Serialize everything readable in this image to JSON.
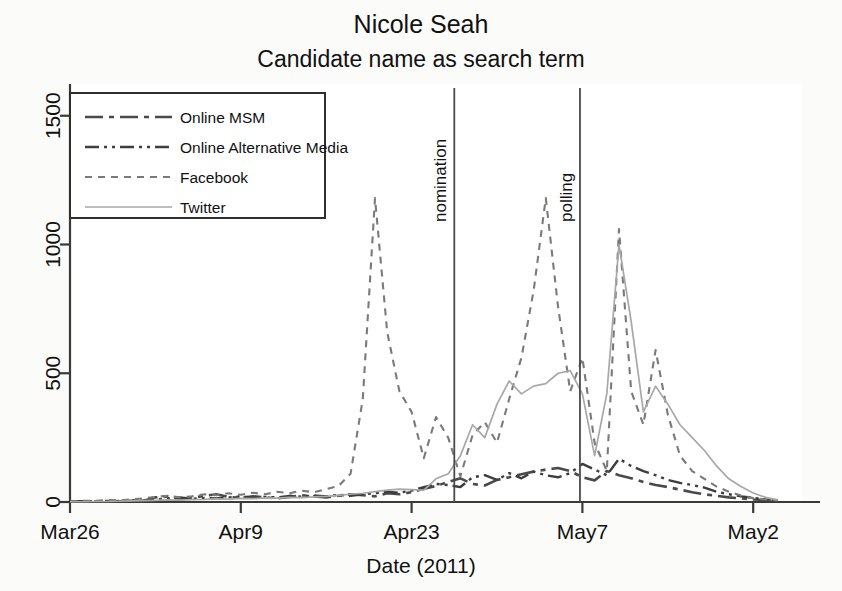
{
  "chart_data": {
    "type": "line",
    "title": "Nicole Seah",
    "subtitle": "Candidate name as search term",
    "xlabel": "Date (2011)",
    "ylabel": "",
    "xlim": [
      0,
      60
    ],
    "ylim": [
      0,
      1600
    ],
    "grid": false,
    "legend_position": "top-left",
    "y_ticks": [
      0,
      500,
      1000,
      1500
    ],
    "y_tick_labels": [
      "0",
      "500",
      "1000",
      "1500"
    ],
    "x_ticks": [
      0,
      14,
      28,
      42,
      56
    ],
    "x_tick_labels": [
      "Mar26",
      "Apr9",
      "Apr23",
      "May7",
      "May2"
    ],
    "annotations": [
      {
        "label": "nomination",
        "x": 31.5
      },
      {
        "label": "polling",
        "x": 41.8
      }
    ],
    "series": [
      {
        "name": "Online MSM",
        "style": "dash-dot-long",
        "color": "#4a4a4a",
        "x": [
          0,
          1,
          2,
          3,
          4,
          5,
          6,
          7,
          8,
          9,
          10,
          11,
          12,
          13,
          14,
          15,
          16,
          17,
          18,
          19,
          20,
          21,
          22,
          23,
          24,
          25,
          26,
          27,
          28,
          29,
          30,
          31,
          32,
          33,
          34,
          35,
          36,
          37,
          38,
          39,
          40,
          41,
          42,
          43,
          44,
          45,
          46,
          47,
          48,
          49,
          50,
          51,
          52,
          53,
          54,
          55,
          56,
          57,
          58
        ],
        "values": [
          2,
          3,
          2,
          4,
          3,
          5,
          4,
          18,
          22,
          12,
          16,
          24,
          30,
          20,
          16,
          22,
          18,
          14,
          20,
          26,
          22,
          18,
          24,
          30,
          26,
          22,
          34,
          30,
          38,
          52,
          62,
          78,
          92,
          70,
          64,
          86,
          96,
          108,
          118,
          126,
          132,
          120,
          96,
          84,
          120,
          104,
          92,
          78,
          66,
          58,
          48,
          38,
          30,
          24,
          18,
          14,
          10,
          8,
          6
        ]
      },
      {
        "name": "Online Alternative Media",
        "style": "dash-dot-dot",
        "color": "#3d3d3d",
        "x": [
          0,
          1,
          2,
          3,
          4,
          5,
          6,
          7,
          8,
          9,
          10,
          11,
          12,
          13,
          14,
          15,
          16,
          17,
          18,
          19,
          20,
          21,
          22,
          23,
          24,
          25,
          26,
          27,
          28,
          29,
          30,
          31,
          32,
          33,
          34,
          35,
          36,
          37,
          38,
          39,
          40,
          41,
          42,
          43,
          44,
          45,
          46,
          47,
          48,
          49,
          50,
          51,
          52,
          53,
          54,
          55,
          56,
          57,
          58
        ],
        "values": [
          1,
          2,
          3,
          2,
          4,
          6,
          5,
          10,
          14,
          18,
          12,
          16,
          14,
          18,
          22,
          16,
          20,
          18,
          24,
          20,
          26,
          22,
          28,
          24,
          30,
          34,
          40,
          36,
          44,
          58,
          70,
          66,
          58,
          96,
          104,
          86,
          112,
          92,
          118,
          104,
          96,
          112,
          148,
          126,
          104,
          168,
          140,
          120,
          104,
          86,
          74,
          66,
          56,
          40,
          30,
          22,
          16,
          10,
          6
        ]
      },
      {
        "name": "Facebook",
        "style": "dashed",
        "color": "#7a7a7a",
        "x": [
          0,
          1,
          2,
          3,
          4,
          5,
          6,
          7,
          8,
          9,
          10,
          11,
          12,
          13,
          14,
          15,
          16,
          17,
          18,
          19,
          20,
          21,
          22,
          23,
          24,
          25,
          26,
          27,
          28,
          29,
          30,
          31,
          32,
          33,
          34,
          35,
          36,
          37,
          38,
          39,
          40,
          41,
          42,
          43,
          44,
          45,
          46,
          47,
          48,
          49,
          50,
          51,
          52,
          53,
          54,
          55,
          56,
          57,
          58
        ],
        "values": [
          3,
          5,
          4,
          8,
          6,
          10,
          14,
          20,
          24,
          18,
          22,
          30,
          26,
          34,
          28,
          36,
          30,
          40,
          34,
          44,
          38,
          50,
          62,
          110,
          400,
          1180,
          660,
          430,
          350,
          170,
          330,
          250,
          100,
          260,
          310,
          230,
          400,
          560,
          820,
          1180,
          760,
          430,
          560,
          230,
          120,
          1060,
          430,
          300,
          590,
          340,
          180,
          120,
          90,
          60,
          40,
          25,
          15,
          10,
          6
        ]
      },
      {
        "name": "Twitter",
        "style": "solid-light",
        "color": "#a8a8a8",
        "x": [
          0,
          1,
          2,
          3,
          4,
          5,
          6,
          7,
          8,
          9,
          10,
          11,
          12,
          13,
          14,
          15,
          16,
          17,
          18,
          19,
          20,
          21,
          22,
          23,
          24,
          25,
          26,
          27,
          28,
          29,
          30,
          31,
          32,
          33,
          34,
          35,
          36,
          37,
          38,
          39,
          40,
          41,
          42,
          43,
          44,
          45,
          46,
          47,
          48,
          49,
          50,
          51,
          52,
          53,
          54,
          55,
          56,
          57,
          58
        ],
        "values": [
          1,
          1,
          2,
          2,
          3,
          4,
          5,
          6,
          8,
          7,
          9,
          10,
          12,
          11,
          14,
          13,
          16,
          15,
          18,
          17,
          20,
          22,
          26,
          30,
          34,
          40,
          46,
          50,
          48,
          46,
          90,
          110,
          180,
          300,
          250,
          380,
          470,
          420,
          450,
          460,
          500,
          510,
          420,
          180,
          420,
          1000,
          700,
          350,
          450,
          380,
          300,
          250,
          200,
          140,
          90,
          60,
          35,
          18,
          8
        ]
      }
    ]
  },
  "legend": {
    "entries": [
      {
        "label": "Online MSM"
      },
      {
        "label": "Online Alternative Media"
      },
      {
        "label": "Facebook"
      },
      {
        "label": "Twitter"
      }
    ]
  }
}
